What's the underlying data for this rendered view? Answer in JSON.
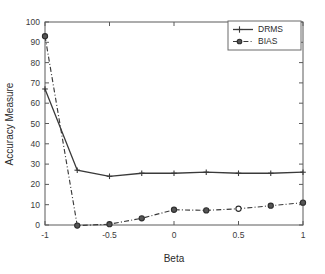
{
  "chart_data": {
    "type": "line",
    "title": "",
    "xlabel": "Beta",
    "ylabel": "Accuracy Measure",
    "xlim": [
      -1,
      1
    ],
    "ylim": [
      0,
      100
    ],
    "grid": false,
    "legend_position": "top-right",
    "x": [
      -1,
      -0.75,
      -0.5,
      -0.25,
      0,
      0.25,
      0.5,
      0.75,
      1
    ],
    "xticks": [
      -1,
      -0.5,
      0,
      0.5,
      1
    ],
    "xtick_labels": [
      "-1",
      "-0.5",
      "0",
      "0.5",
      "1"
    ],
    "yticks": [
      0,
      10,
      20,
      30,
      40,
      50,
      60,
      70,
      80,
      90,
      100
    ],
    "ytick_labels": [
      "0",
      "10",
      "20",
      "30",
      "40",
      "50",
      "60",
      "70",
      "80",
      "90",
      "100"
    ],
    "series": [
      {
        "name": "DRMS",
        "linestyle": "solid",
        "marker": "plus",
        "color": "#3a3a3a",
        "values": [
          67,
          27,
          24,
          25.5,
          25.5,
          26,
          25.5,
          25.5,
          26
        ]
      },
      {
        "name": "BIAS",
        "linestyle": "dash-dot",
        "marker": "circle",
        "color": "#3a3a3a",
        "values": [
          93,
          -0.3,
          0.4,
          3.3,
          7.5,
          7.2,
          8,
          9.5,
          11
        ]
      }
    ]
  },
  "legend": {
    "entries": [
      {
        "label": "DRMS"
      },
      {
        "label": "BIAS"
      }
    ]
  },
  "axes": {
    "x_title": "Beta",
    "y_title": "Accuracy Measure"
  }
}
